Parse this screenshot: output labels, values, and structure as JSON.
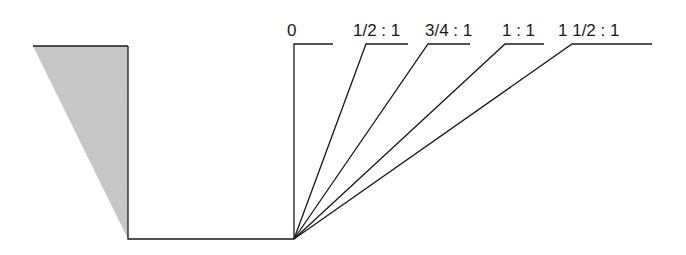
{
  "diagram": {
    "type": "excavation-slope-diagram",
    "colors": {
      "line": "#1a1a1a",
      "soil_fill": "#c8c8c8",
      "background": "#ffffff"
    },
    "soil_wedge": {
      "points": [
        [
          33,
          46
        ],
        [
          128,
          46
        ],
        [
          128,
          239
        ]
      ]
    },
    "trench": {
      "left_wall": {
        "x": 128,
        "y_top": 46,
        "y_bottom": 239
      },
      "floor": {
        "x1": 128,
        "x2": 294,
        "y": 239
      }
    },
    "origin": {
      "x": 294,
      "y": 239
    },
    "slopes": [
      {
        "label": "0",
        "label_x": 287,
        "top_x": 294,
        "end_x": 333
      },
      {
        "label": "1/2 : 1",
        "label_x": 353,
        "top_x": 366,
        "end_x": 408
      },
      {
        "label": "3/4 : 1",
        "label_x": 425,
        "top_x": 428,
        "end_x": 470
      },
      {
        "label": "1 : 1",
        "label_x": 502,
        "top_x": 505,
        "end_x": 544
      },
      {
        "label": "1 1/2 : 1",
        "label_x": 558,
        "top_x": 572,
        "end_x": 652
      }
    ],
    "top_y": 44,
    "label_y": 36
  }
}
